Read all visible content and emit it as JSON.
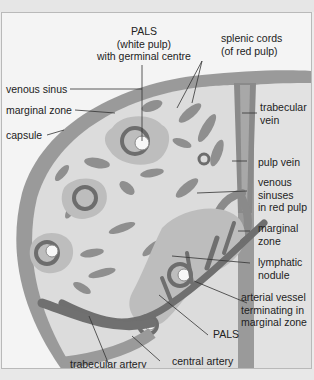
{
  "diagram": {
    "colors": {
      "background": "#f4f4f4",
      "capsule": "#9a9a9a",
      "red_pulp": "#dcdcdc",
      "cords": "#8f8f8f",
      "marginal_zone": "#bdbdbd",
      "pals_ring": "#6d6d6d",
      "germinal_centre": "#f7f7f7",
      "vein": "#8a8a8a",
      "artery": "#6f6f6f",
      "leader_line": "#333333"
    },
    "labels": {
      "pals_white_pulp": [
        "PALS",
        "(white pulp)",
        "with germinal centre"
      ],
      "splenic_cords": [
        "splenic cords",
        "(of red pulp)"
      ],
      "venous_sinus": "venous sinus",
      "marginal_zone_top": "marginal zone",
      "capsule": "capsule",
      "trabecular_vein": [
        "trabecular",
        "vein"
      ],
      "pulp_vein": "pulp vein",
      "venous_sinuses_red_pulp": [
        "venous",
        "sinuses",
        "in red pulp"
      ],
      "marginal_zone_right": [
        "marginal",
        "zone"
      ],
      "lymphatic_nodule": [
        "lymphatic",
        "nodule"
      ],
      "arterial_vessel": [
        "arterial vessel",
        "terminating in",
        "marginal zone"
      ],
      "pals": "PALS",
      "central_artery": "central artery",
      "trabecular_artery": "trabecular artery"
    }
  }
}
